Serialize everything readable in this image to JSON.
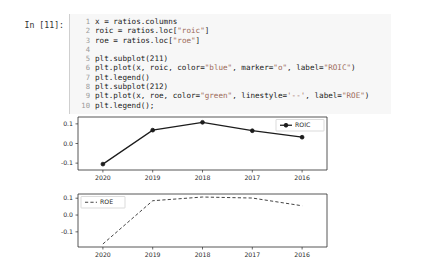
{
  "cell": {
    "prompt": "In [11]:",
    "code_lines": [
      {
        "n": "1",
        "text": "x = ratios.columns"
      },
      {
        "n": "2",
        "text": "roic = ratios.loc[\"roic\"]"
      },
      {
        "n": "3",
        "text": "roe = ratios.loc[\"roe\"]"
      },
      {
        "n": "4",
        "text": ""
      },
      {
        "n": "5",
        "text": "plt.subplot(211)"
      },
      {
        "n": "6",
        "text": "plt.plot(x, roic, color=\"blue\", marker=\"o\", label=\"ROIC\")"
      },
      {
        "n": "7",
        "text": "plt.legend()"
      },
      {
        "n": "8",
        "text": "plt.subplot(212)"
      },
      {
        "n": "9",
        "text": "plt.plot(x, roe, color=\"green\", linestyle='--', label=\"ROE\")"
      },
      {
        "n": "10",
        "text": "plt.legend();"
      }
    ]
  },
  "chart_data": [
    {
      "type": "line",
      "subplot": "211",
      "title": "",
      "xlabel": "",
      "ylabel": "",
      "categories": [
        "2020",
        "2019",
        "2018",
        "2017",
        "2016"
      ],
      "xticklabels": [
        "2020",
        "2019",
        "2018",
        "2017",
        "2016"
      ],
      "yticklabels": [
        "0.1",
        "0.0",
        "-0.1"
      ],
      "ytickvalues": [
        0.1,
        0.0,
        -0.1
      ],
      "ylim": [
        -0.135,
        0.135
      ],
      "grid": false,
      "legend_position": "upper right",
      "series": [
        {
          "name": "ROIC",
          "label": "ROIC",
          "color": "blue",
          "rendered_color": "#1c1c1c",
          "marker": "o",
          "linestyle": "-",
          "values": [
            -0.105,
            0.068,
            0.108,
            0.065,
            0.032
          ]
        }
      ]
    },
    {
      "type": "line",
      "subplot": "212",
      "title": "",
      "xlabel": "",
      "ylabel": "",
      "categories": [
        "2020",
        "2019",
        "2018",
        "2017",
        "2016"
      ],
      "xticklabels": [
        "2020",
        "2019",
        "2018",
        "2017",
        "2016"
      ],
      "yticklabels": [
        "0.1",
        "0.0",
        "-0.1"
      ],
      "ytickvalues": [
        0.1,
        0.0,
        -0.1
      ],
      "ylim": [
        -0.19,
        0.125
      ],
      "grid": false,
      "legend_position": "upper left",
      "series": [
        {
          "name": "ROE",
          "label": "ROE",
          "color": "green",
          "rendered_color": "#3a3a3a",
          "marker": "",
          "linestyle": "--",
          "values": [
            -0.172,
            0.085,
            0.107,
            0.101,
            0.055
          ]
        }
      ]
    }
  ]
}
